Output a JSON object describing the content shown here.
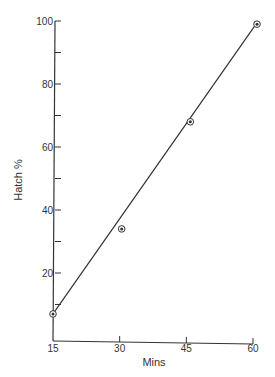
{
  "chart_data": {
    "type": "scatter",
    "title": "",
    "xlabel": "Mins",
    "ylabel": "Hatch %",
    "x_ticks": [
      15,
      30,
      45,
      60
    ],
    "y_ticks_labeled": [
      20,
      40,
      60,
      80,
      100
    ],
    "y_ticks_minor": [
      10,
      30,
      50,
      70,
      90
    ],
    "xlim": [
      15,
      60
    ],
    "ylim": [
      0,
      100
    ],
    "grid": false,
    "legend": null,
    "series": [
      {
        "name": "Hatch %",
        "points": [
          {
            "x": 15,
            "y": 7
          },
          {
            "x": 30,
            "y": 34
          },
          {
            "x": 45,
            "y": 68
          },
          {
            "x": 60,
            "y": 99
          }
        ],
        "marker": "circled-dot",
        "fit_line": {
          "x0": 15,
          "y0": 7,
          "x1": 60,
          "y1": 99
        }
      }
    ]
  },
  "colors": {
    "ink": "#333333",
    "background": "#ffffff"
  }
}
